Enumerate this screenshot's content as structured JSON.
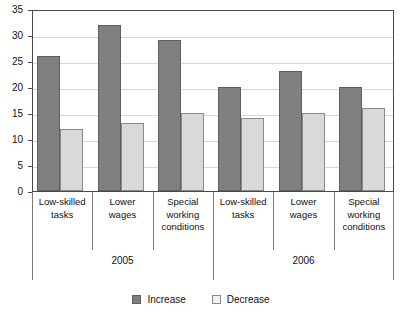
{
  "chart_data": {
    "type": "bar",
    "title": "",
    "subtitle": "",
    "xlabel": "",
    "ylabel": "",
    "ylim": [
      0,
      35
    ],
    "ytick_step": 5,
    "yticks": [
      0,
      5,
      10,
      15,
      20,
      25,
      30,
      35
    ],
    "ytick_labels": [
      "0",
      "5",
      "10",
      "15",
      "20",
      "25",
      "30",
      "35"
    ],
    "grid": true,
    "grid_axis": "y",
    "legend_position": "bottom",
    "categories": [
      "Low-skilled tasks",
      "Lower wages",
      "Special working conditions",
      "Low-skilled tasks",
      "Lower wages",
      "Special working conditions"
    ],
    "groups": [
      {
        "label": "2005",
        "categories": [
          "Low-skilled tasks",
          "Lower wages",
          "Special working conditions"
        ]
      },
      {
        "label": "2006",
        "categories": [
          "Low-skilled tasks",
          "Lower wages",
          "Special working conditions"
        ]
      }
    ],
    "series": [
      {
        "name": "Increase",
        "color": "#808080",
        "values": [
          26,
          32,
          29,
          20,
          23,
          20
        ]
      },
      {
        "name": "Decrease",
        "color": "#D9D9D9",
        "values": [
          12,
          13,
          15,
          14,
          15,
          16
        ]
      }
    ],
    "annotations": []
  },
  "axis": {
    "y_ticks": [
      {
        "label": "35",
        "value": 35
      },
      {
        "label": "30",
        "value": 30
      },
      {
        "label": "25",
        "value": 25
      },
      {
        "label": "20",
        "value": 20
      },
      {
        "label": "15",
        "value": 15
      },
      {
        "label": "10",
        "value": 10
      },
      {
        "label": "5",
        "value": 5
      },
      {
        "label": "0",
        "value": 0
      }
    ]
  },
  "categories": [
    {
      "line1": "Low-skilled",
      "line2": "tasks",
      "line3": ""
    },
    {
      "line1": "Lower",
      "line2": "wages",
      "line3": ""
    },
    {
      "line1": "Special",
      "line2": "working",
      "line3": "conditions"
    },
    {
      "line1": "Low-skilled",
      "line2": "tasks",
      "line3": ""
    },
    {
      "line1": "Lower",
      "line2": "wages",
      "line3": ""
    },
    {
      "line1": "Special",
      "line2": "working",
      "line3": "conditions"
    }
  ],
  "years": [
    {
      "label": "2005"
    },
    {
      "label": "2006"
    }
  ],
  "legend": {
    "items": [
      {
        "label": "Increase",
        "color": "#808080"
      },
      {
        "label": "Decrease",
        "color": "#D9D9D9"
      }
    ]
  }
}
